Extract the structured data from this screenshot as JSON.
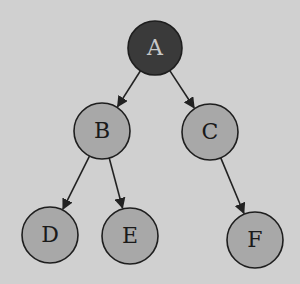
{
  "diagram": {
    "type": "binary-tree",
    "background_color": "#d0d0d0",
    "nodes": [
      {
        "id": "A",
        "label": "A",
        "cx": 155,
        "cy": 48,
        "r": 27,
        "fill": "#3a3a3a",
        "text_color": "#c8c8c8",
        "role": "root"
      },
      {
        "id": "B",
        "label": "B",
        "cx": 102,
        "cy": 131,
        "r": 28,
        "fill": "#a8a8a8",
        "text_color": "#1a1a1a",
        "role": "internal"
      },
      {
        "id": "C",
        "label": "C",
        "cx": 210,
        "cy": 132,
        "r": 28,
        "fill": "#a8a8a8",
        "text_color": "#1a1a1a",
        "role": "internal"
      },
      {
        "id": "D",
        "label": "D",
        "cx": 50,
        "cy": 235,
        "r": 28,
        "fill": "#a8a8a8",
        "text_color": "#1a1a1a",
        "role": "leaf"
      },
      {
        "id": "E",
        "label": "E",
        "cx": 130,
        "cy": 236,
        "r": 28,
        "fill": "#a8a8a8",
        "text_color": "#1a1a1a",
        "role": "leaf"
      },
      {
        "id": "F",
        "label": "F",
        "cx": 255,
        "cy": 240,
        "r": 28,
        "fill": "#a8a8a8",
        "text_color": "#1a1a1a",
        "role": "leaf"
      }
    ],
    "edges": [
      {
        "from": "A",
        "to": "B",
        "directed": true
      },
      {
        "from": "A",
        "to": "C",
        "directed": true
      },
      {
        "from": "B",
        "to": "D",
        "directed": true
      },
      {
        "from": "B",
        "to": "E",
        "directed": true
      },
      {
        "from": "C",
        "to": "F",
        "directed": true
      }
    ],
    "edge_color": "#222222",
    "node_stroke": "#1e1e1e"
  }
}
